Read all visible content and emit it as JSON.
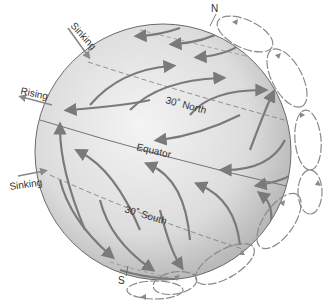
{
  "diagram": {
    "labels": {
      "north_pole": "N",
      "south_pole": "S",
      "lat_30_north": "30˚ North",
      "equator": "Equator",
      "lat_30_south": "30˚ South",
      "sinking_top": "Sinking",
      "rising": "Rising",
      "sinking_bottom": "Sinking"
    },
    "colors": {
      "globe_fill_light": "#f2f2f2",
      "globe_fill_dark": "#b5b5b5",
      "arrow": "#7a7a7a",
      "outline": "#6a6a6a",
      "cell": "#8a8a8a"
    },
    "circulation_cells_count": 8
  }
}
